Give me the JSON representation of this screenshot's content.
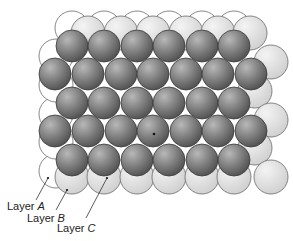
{
  "figure": {
    "colors": {
      "layer_a_fill": "#ffffff",
      "layer_b_fill": "#e2e2e2",
      "layer_c_fill": "#7a7a7a",
      "outline": "#555555"
    },
    "labels": [
      {
        "prefix": "Layer ",
        "letter": "A"
      },
      {
        "prefix": "Layer ",
        "letter": "B"
      },
      {
        "prefix": "Layer ",
        "letter": "C"
      }
    ]
  }
}
